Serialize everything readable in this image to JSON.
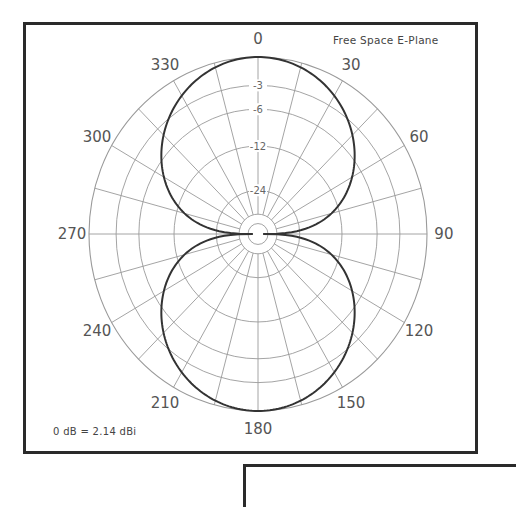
{
  "chart_data": {
    "type": "polar",
    "title": "Free Space E-Plane",
    "annotation": "0 dB = 2.14 dBi",
    "scale": "ARRL log-periodic (0.89 per 2 dB)",
    "angle_labels": [
      "0",
      "30",
      "60",
      "90",
      "120",
      "150",
      "180",
      "210",
      "240",
      "270",
      "300",
      "330"
    ],
    "angle_label_values": [
      0,
      30,
      60,
      90,
      120,
      150,
      180,
      210,
      240,
      270,
      300,
      330
    ],
    "spoke_step_deg": 15,
    "ring_labels": [
      "-3",
      "-6",
      "-12",
      "-24"
    ],
    "ring_db": [
      0,
      -3,
      -6,
      -12,
      -24
    ],
    "inner_ring_fractions": [
      0.112,
      0.059
    ],
    "series": [
      {
        "name": "Half-wave dipole E-plane",
        "angles_deg": [
          0,
          15,
          30,
          45,
          60,
          75,
          90,
          105,
          120,
          135,
          150,
          165,
          180,
          195,
          210,
          225,
          240,
          255,
          270,
          285,
          300,
          315,
          330,
          345
        ],
        "gain_db": [
          0,
          -0.44,
          -1.76,
          -4.04,
          -7.59,
          -13.69,
          null,
          -13.69,
          -7.59,
          -4.04,
          -1.76,
          -0.44,
          0,
          -0.44,
          -1.76,
          -4.04,
          -7.59,
          -13.69,
          null,
          -13.69,
          -7.59,
          -4.04,
          -1.76,
          -0.44
        ]
      }
    ],
    "rlim_db": [
      -50,
      0
    ],
    "grid": true,
    "legend": null
  },
  "layout": {
    "cx": 258,
    "cy": 234,
    "rx": 169,
    "ry": 177
  }
}
